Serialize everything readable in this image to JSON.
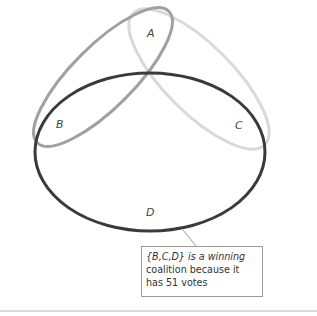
{
  "diagram": {
    "sets": [
      {
        "id": "A",
        "label": "A",
        "color": "#d6d6d6"
      },
      {
        "id": "B",
        "label": "B",
        "color": "#9e9e9e"
      },
      {
        "id": "C",
        "label": "C",
        "color": "#d6d6d6"
      },
      {
        "id": "D",
        "label": "D",
        "color": "#333333"
      }
    ],
    "labels": {
      "A": "A",
      "B": "B",
      "C": "C",
      "D": "D"
    },
    "callout": {
      "text": "{B,C,D} is a winning coalition because it has 51 votes",
      "line1": "{B,C,D} is a winning",
      "line2": "coalition because it",
      "line3": "has 51 votes"
    }
  }
}
